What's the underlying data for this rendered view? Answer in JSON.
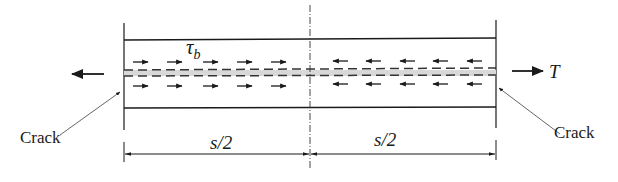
{
  "diagram": {
    "type": "bond-slip schematic",
    "labels": {
      "shear_stress": "τ",
      "shear_stress_sub": "b",
      "force": "T",
      "crack_left": "Crack",
      "crack_right": "Crack",
      "half_span_left": "s/2",
      "half_span_right": "s/2"
    },
    "arrows": {
      "left_half_direction": "right",
      "right_half_direction": "left",
      "per_row_count": 5,
      "rows": 2
    },
    "colors": {
      "line": "#1a1a1a",
      "band": "#d8d8d8"
    }
  }
}
